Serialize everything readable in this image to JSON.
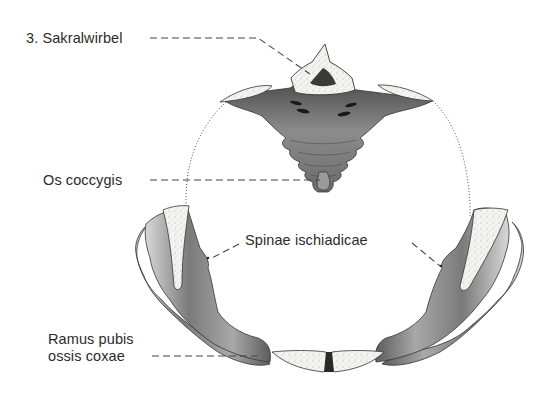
{
  "diagram": {
    "labels": [
      {
        "id": "sacral",
        "text": "3. Sakralwirbel"
      },
      {
        "id": "coccyx",
        "text": "Os coccygis"
      },
      {
        "id": "spinae",
        "text": "Spinae ischiadicae"
      },
      {
        "id": "ramus_line1",
        "text": "Ramus pubis"
      },
      {
        "id": "ramus_line2",
        "text": "ossis coxae"
      }
    ],
    "structures": [
      "3rd sacral vertebra",
      "coccyx",
      "left hip bone",
      "right hip bone",
      "ischial spines",
      "pubic symphysis"
    ],
    "colors": {
      "text": "#2b2b2b",
      "bone_dark": "#5a5a5a",
      "bone_mid": "#9a9a9a",
      "bone_light": "#e8e8e8",
      "cut_surface": "#f2f2ee",
      "leader_line": "#444444"
    }
  }
}
